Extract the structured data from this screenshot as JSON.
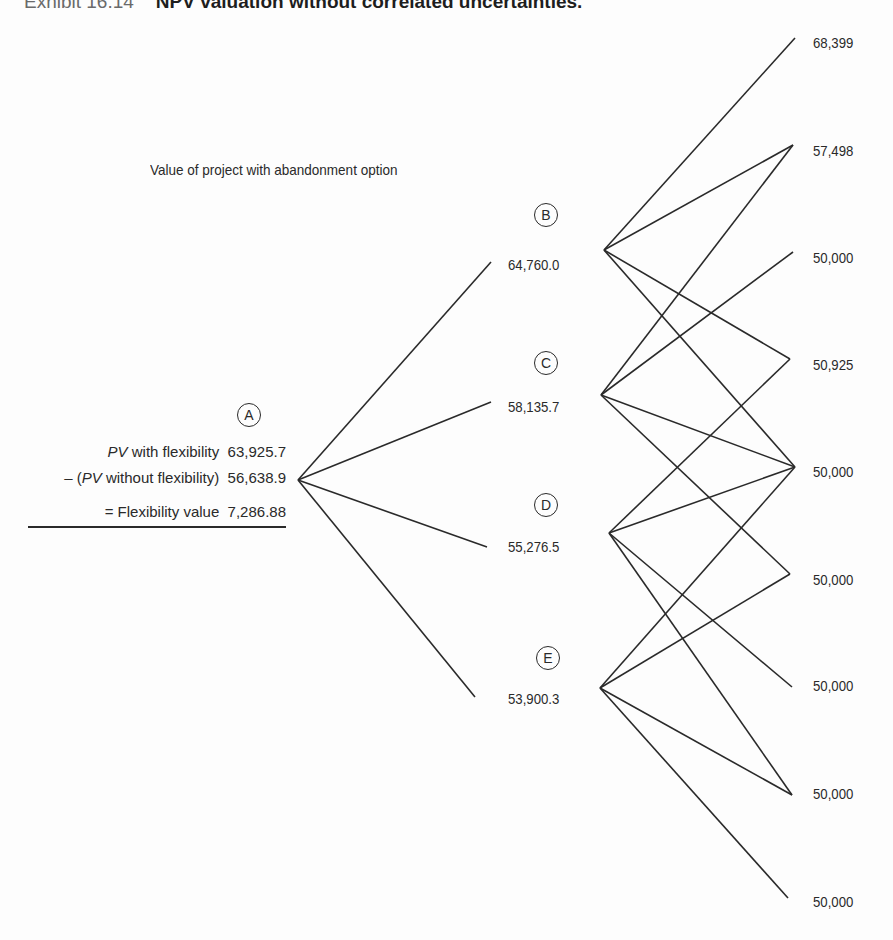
{
  "header": {
    "exhibit": "Exhibit 16.14",
    "title": "NPV valuation without correlated uncertainties."
  },
  "note": "Value of project with abandonment option",
  "root": {
    "id": "A",
    "pv_with_flex_label_italic": "PV",
    "pv_with_flex_label_rest": " with flexibility",
    "pv_with_flex_value": "63,925.7",
    "pv_without_prefix": "– (",
    "pv_without_label_italic": "PV",
    "pv_without_label_rest": " without flexibility)",
    "pv_without_value": "56,638.9",
    "flex_value_label": "= Flexibility value",
    "flex_value": "7,286.88"
  },
  "middle_nodes": [
    {
      "id": "B",
      "value": "64,760.0"
    },
    {
      "id": "C",
      "value": "58,135.7"
    },
    {
      "id": "D",
      "value": "55,276.5"
    },
    {
      "id": "E",
      "value": "53,900.3"
    }
  ],
  "terminal_values": [
    "68,399",
    "57,498",
    "50,000",
    "50,925",
    "50,000",
    "50,000",
    "50,000",
    "50,000",
    "50,000"
  ],
  "edges": {
    "A": [
      "B",
      "C",
      "D",
      "E"
    ],
    "B": [
      1,
      2,
      4,
      5
    ],
    "C": [
      2,
      3,
      5,
      6
    ],
    "D": [
      4,
      5,
      7,
      8
    ],
    "E": [
      5,
      6,
      8,
      9
    ]
  },
  "colors": {
    "line": "#2a2a2a",
    "background": "#fdfdfd"
  }
}
